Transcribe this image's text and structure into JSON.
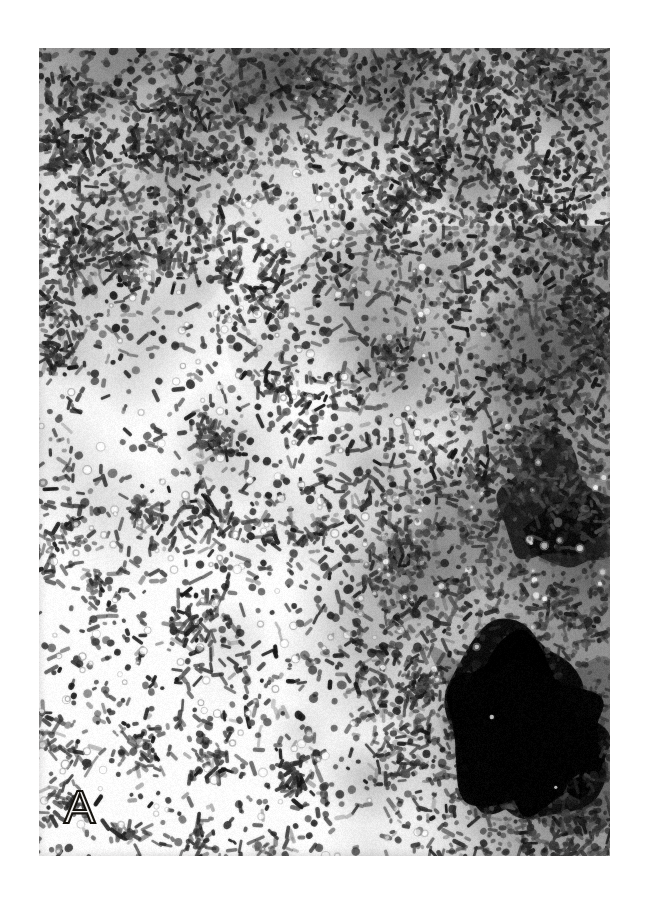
{
  "figure": {
    "domain": "natural-image",
    "kind": "light-microscopy-photomicrograph",
    "panel_label": "A",
    "background_color": "#ffffff",
    "plate": {
      "x": 39,
      "y": 48,
      "width": 571,
      "height": 808,
      "border": "none",
      "tone": "grayscale",
      "field_color_light": "#f7f6f4",
      "field_color_mid": "#8d8b88",
      "field_color_dark": "#2d2b27",
      "field_color_black": "#0c0b09"
    },
    "label_style": {
      "color_fill": "#f2f1ef",
      "color_stroke": "#16140f",
      "font_size_px": 47,
      "x": 64,
      "y": 783
    },
    "content_description": {
      "particles": "rod-shaped bacilli and coccoid cells scattered across a pale background",
      "aggregates": "dense dark clumps forming a band across the top and a broad mass along the right edge",
      "dark_blob": "large near-black amorphous aggregate in the lower right quadrant",
      "vacuoles": "small pale ring-like circles distributed through the field"
    },
    "render_seed": 20240917,
    "density": {
      "rods": 5200,
      "cocci": 1400,
      "rings": 260,
      "clumps": 150
    }
  }
}
